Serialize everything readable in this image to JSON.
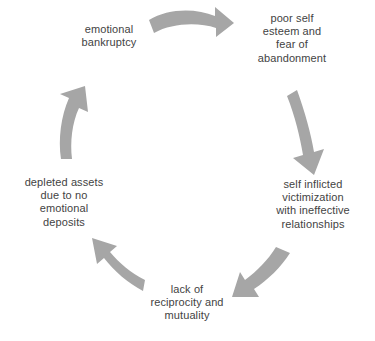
{
  "diagram": {
    "type": "cycle",
    "title": "",
    "colors": {
      "arrow": "#a6a6a6",
      "text": "#434343",
      "background": "#ffffff"
    },
    "nodes": [
      {
        "id": "poor-self-esteem",
        "order": 1,
        "text": "poor self\nesteem and\nfear of\nabandonment",
        "lines": [
          "poor self",
          "esteem and",
          "fear of",
          "abandonment"
        ]
      },
      {
        "id": "self-inflicted-victimization",
        "order": 2,
        "text": "self inflicted\nvictimization\nwith ineffective\nrelationships",
        "lines": [
          "self inflicted",
          "victimization",
          "with ineffective",
          "relationships"
        ]
      },
      {
        "id": "lack-of-reciprocity",
        "order": 3,
        "text": "lack of\nreciprocity and\nmutuality",
        "lines": [
          "lack of",
          "reciprocity and",
          "mutuality"
        ]
      },
      {
        "id": "depleted-assets",
        "order": 4,
        "text": "depleted assets\ndue to no\nemotional\ndeposits",
        "lines": [
          "depleted assets",
          "due to no",
          "emotional",
          "deposits"
        ]
      },
      {
        "id": "emotional-bankruptcy",
        "order": 5,
        "text": "emotional\nbankruptcy",
        "lines": [
          "emotional",
          "bankruptcy"
        ]
      }
    ],
    "arrows": [
      {
        "id": "arrow-top",
        "from": "emotional-bankruptcy",
        "to": "poor-self-esteem",
        "direction": "right"
      },
      {
        "id": "arrow-right",
        "from": "poor-self-esteem",
        "to": "self-inflicted-victimization",
        "direction": "down"
      },
      {
        "id": "arrow-bottom-right",
        "from": "self-inflicted-victimization",
        "to": "lack-of-reciprocity",
        "direction": "down-left"
      },
      {
        "id": "arrow-bottom-left",
        "from": "lack-of-reciprocity",
        "to": "depleted-assets",
        "direction": "up-left"
      },
      {
        "id": "arrow-left",
        "from": "depleted-assets",
        "to": "emotional-bankruptcy",
        "direction": "up"
      }
    ]
  }
}
